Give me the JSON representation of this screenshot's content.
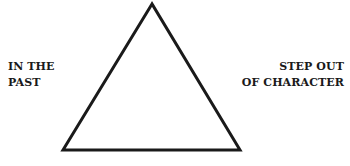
{
  "diagram": {
    "shape": "triangle",
    "stroke_color": "#1a1a1a",
    "fill_color": "#ffffff",
    "vertices": {
      "apex": [
        152,
        4
      ],
      "bottom_left": [
        63,
        150
      ],
      "bottom_right": [
        240,
        150
      ]
    },
    "left_label": {
      "line1": "IN THE",
      "line2": "PAST"
    },
    "right_label": {
      "line1": "STEP OUT",
      "line2": "OF CHARACTER"
    }
  }
}
